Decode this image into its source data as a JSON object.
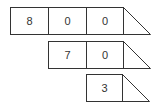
{
  "diagram": {
    "rows": [
      {
        "digits": [
          "8",
          "0",
          "0"
        ]
      },
      {
        "digits": [
          "7",
          "0"
        ]
      },
      {
        "digits": [
          "3"
        ]
      }
    ],
    "colors": {
      "stroke": "#333333",
      "text": "#333333",
      "background": "#ffffff"
    }
  }
}
